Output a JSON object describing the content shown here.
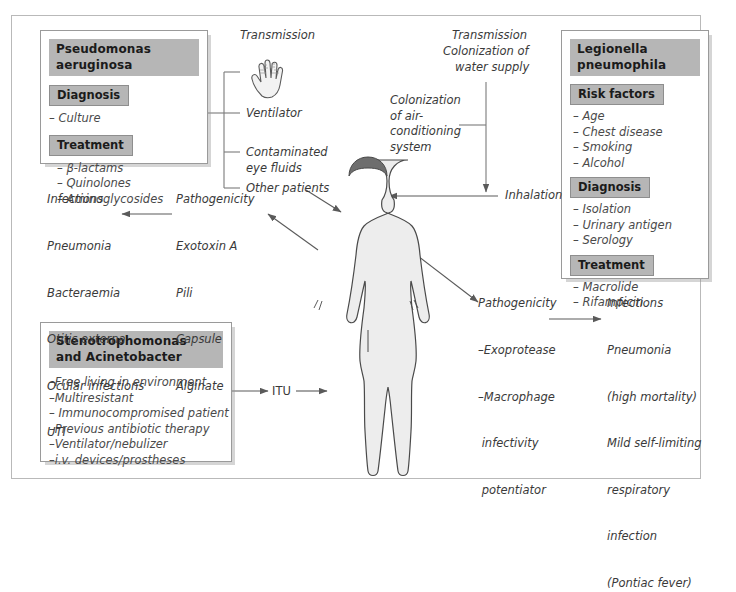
{
  "diagram": {
    "type": "medical-concept-diagram",
    "figure_label": "human-body-silhouette",
    "colors": {
      "header_gray": "#b6b6b6",
      "box_border": "#9a9a9a",
      "frame_border": "#b9b9b9",
      "text": "#3a3a3a",
      "body_fill": "#ededed",
      "hair": "#6e6e6e"
    }
  },
  "pseudomonas_box": {
    "title": "Pseudomonas aeruginosa",
    "sections": [
      {
        "heading": "Diagnosis",
        "items": [
          "– Culture"
        ]
      },
      {
        "heading": "Treatment",
        "items": [
          "– β-lactams",
          "– Quinolones",
          "– Aminoglycosides"
        ]
      }
    ]
  },
  "legionella_box": {
    "title": "Legionella pneumophila",
    "sections": [
      {
        "heading": "Risk factors",
        "items": [
          "– Age",
          "– Chest disease",
          "– Smoking",
          "– Alcohol"
        ]
      },
      {
        "heading": "Diagnosis",
        "items": [
          "– Isolation",
          "– Urinary antigen",
          "– Serology"
        ]
      },
      {
        "heading": "Treatment",
        "items": [
          "– Macrolide",
          "– Rifampicin"
        ]
      }
    ]
  },
  "steno_box": {
    "title_line1": "Stenotrophomonas",
    "title_line2": "and Acinetobacter",
    "items": [
      "–Free living in environment",
      "–Multiresistant",
      "– Immunocompromised patient",
      "–Previous antibiotic therapy",
      "–Ventilator/nebulizer",
      "–i.v. devices/prostheses"
    ]
  },
  "pseudomonas_transmission": {
    "label": "Transmission",
    "icon": "hand-icon",
    "items": [
      "Ventilator",
      "Contaminated\neye fluids",
      "Other patients"
    ]
  },
  "pseudomonas_pathogenicity": {
    "heading": "Pathogenicity",
    "items": [
      "Exotoxin A",
      "Pili",
      "Capsule",
      "Alginate"
    ]
  },
  "pseudomonas_infections": {
    "heading": "Infections",
    "items": [
      "Pneumonia",
      "Bacteraemia",
      "Otitis externa",
      "Ocular infections",
      "UTI"
    ]
  },
  "legionella_transmission": {
    "line1": "Transmission",
    "line2": "Colonization of",
    "line3": "water supply",
    "aircon": "Colonization\nof air-\nconditioning\nsystem",
    "inhalation": "Inhalation"
  },
  "legionella_pathogenicity": {
    "heading": "Pathogenicity",
    "items": [
      "–Exoprotease",
      "–Macrophage",
      " infectivity",
      " potentiator"
    ]
  },
  "legionella_infections": {
    "heading": "Infections",
    "items": [
      "Pneumonia",
      "(high mortality)",
      "Mild self-limiting",
      "respiratory",
      "infection",
      "(Pontiac fever)"
    ]
  },
  "itu": {
    "label": "ITU"
  }
}
